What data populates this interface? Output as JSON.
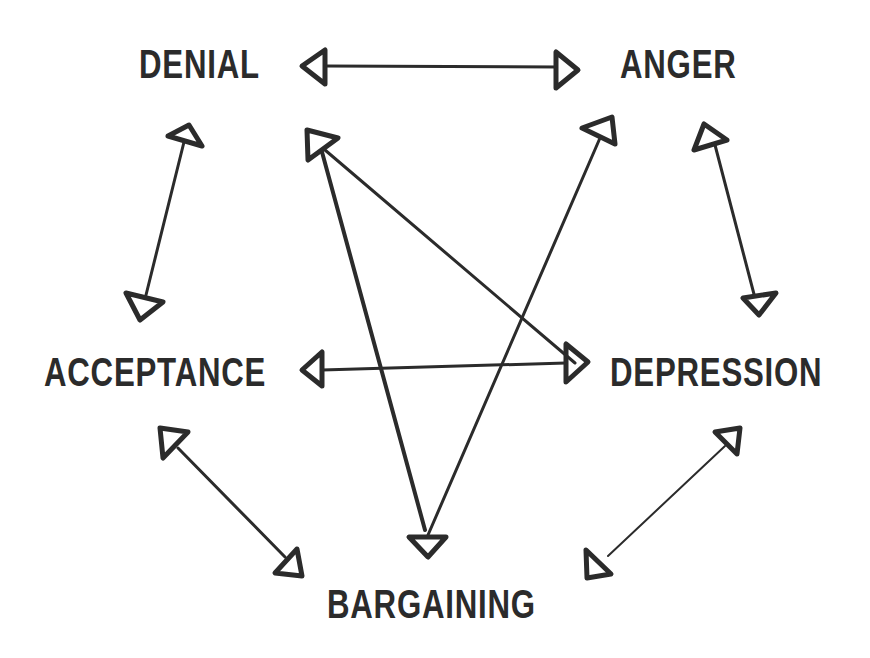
{
  "diagram": {
    "title": "",
    "colors": {
      "ink": "#2b2b2b",
      "background": "#ffffff"
    },
    "nodes": [
      {
        "id": "denial",
        "label": "DENIAL"
      },
      {
        "id": "anger",
        "label": "ANGER"
      },
      {
        "id": "acceptance",
        "label": "ACCEPTANCE"
      },
      {
        "id": "depression",
        "label": "DEPRESSION"
      },
      {
        "id": "bargaining",
        "label": "BARGAINING"
      }
    ],
    "edges": [
      {
        "from": "denial",
        "to": "anger",
        "direction": "both"
      },
      {
        "from": "denial",
        "to": "acceptance",
        "direction": "both"
      },
      {
        "from": "anger",
        "to": "depression",
        "direction": "both"
      },
      {
        "from": "acceptance",
        "to": "depression",
        "direction": "both"
      },
      {
        "from": "acceptance",
        "to": "bargaining",
        "direction": "both"
      },
      {
        "from": "depression",
        "to": "bargaining",
        "direction": "both"
      },
      {
        "from": "denial",
        "to": "depression",
        "direction": "both"
      },
      {
        "from": "denial",
        "to": "bargaining",
        "direction": "both"
      },
      {
        "from": "anger",
        "to": "bargaining",
        "direction": "both"
      }
    ]
  }
}
